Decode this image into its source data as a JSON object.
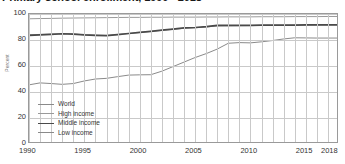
{
  "title": "Primary school enrollment, 1990 - 2018",
  "y_axis_label": "Percent",
  "legend_position": "inside-bottom-left",
  "colors": {
    "world": "#8a8a8a",
    "high_income": "#9a9a9a",
    "middle_income": "#4a4a4a",
    "low_income": "#8a8a8a",
    "grid": "#c9c9c9",
    "frame": "#9a9a9a",
    "text": "#333333"
  },
  "legend": [
    {
      "label": "World",
      "key": "world"
    },
    {
      "label": "High income",
      "key": "high_income"
    },
    {
      "label": "Middle income",
      "key": "middle_income"
    },
    {
      "label": "Low income",
      "key": "low_income"
    }
  ],
  "yticks": [
    "100",
    "80",
    "60",
    "40",
    "20",
    "0"
  ],
  "xticks": [
    "1990",
    "1995",
    "2000",
    "2005",
    "2010",
    "2015",
    "2018"
  ],
  "chart_data": {
    "type": "line",
    "title": "Primary school enrollment, 1990 - 2018",
    "xlabel": "",
    "ylabel": "Percent",
    "xlim": [
      1990,
      2018
    ],
    "ylim": [
      0,
      100
    ],
    "grid": true,
    "legend": [
      "World",
      "High income",
      "Middle income",
      "Low income"
    ],
    "x": [
      1990,
      1991,
      1992,
      1993,
      1994,
      1995,
      1996,
      1997,
      1998,
      1999,
      2000,
      2001,
      2002,
      2003,
      2004,
      2005,
      2006,
      2007,
      2008,
      2009,
      2010,
      2011,
      2012,
      2013,
      2014,
      2015,
      2016,
      2017,
      2018
    ],
    "series": [
      {
        "name": "World",
        "values": [
          84.0,
          84.3,
          84.5,
          84.8,
          84.6,
          84.0,
          83.7,
          83.5,
          84.2,
          85.0,
          85.8,
          86.6,
          87.4,
          88.2,
          89.0,
          89.4,
          90.0,
          90.8,
          90.9,
          91.0,
          91.1,
          91.2,
          91.3,
          91.3,
          91.4,
          91.5,
          91.6,
          91.7,
          91.8
        ]
      },
      {
        "name": "High income",
        "values": [
          96.3,
          96.5,
          96.6,
          96.8,
          96.9,
          97.0,
          97.1,
          97.2,
          97.3,
          97.4,
          97.4,
          97.5,
          97.5,
          97.6,
          97.6,
          97.6,
          97.7,
          97.7,
          97.8,
          97.8,
          97.8,
          97.9,
          97.9,
          97.9,
          98.0,
          98.0,
          98.0,
          98.1,
          98.1
        ]
      },
      {
        "name": "Middle income",
        "values": [
          83.5,
          84.0,
          84.4,
          84.8,
          84.5,
          83.9,
          83.6,
          83.3,
          84.1,
          85.0,
          85.9,
          86.7,
          87.6,
          88.4,
          89.3,
          89.6,
          90.3,
          91.2,
          91.2,
          91.3,
          91.3,
          91.4,
          91.4,
          91.5,
          91.5,
          91.6,
          91.6,
          91.7,
          91.7
        ]
      },
      {
        "name": "Low income",
        "values": [
          45.5,
          47.0,
          46.5,
          45.9,
          46.5,
          48.5,
          50.0,
          50.5,
          51.8,
          53.0,
          53.2,
          53.3,
          56.0,
          59.5,
          63.0,
          66.5,
          69.5,
          73.0,
          77.5,
          78.0,
          77.8,
          78.6,
          79.6,
          80.8,
          81.7,
          81.6,
          81.5,
          81.5,
          81.5
        ]
      }
    ]
  }
}
